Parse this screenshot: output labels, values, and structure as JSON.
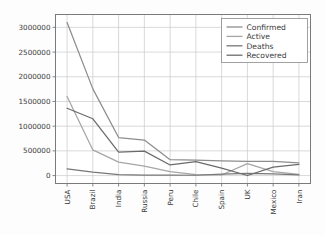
{
  "figure": {
    "background_color": "#fdfdfd",
    "plot_background_color": "#ffffff",
    "frame_color": "#7a7a7a",
    "grid_color": "#c8c8c8",
    "tick_label_color": "#3a3a3a"
  },
  "legend": {
    "position": "upper-right",
    "border_color": "#8a8a8a",
    "background_color": "#ffffff",
    "entries": [
      {
        "label": "Confirmed",
        "color": "#8d8d8d"
      },
      {
        "label": "Active",
        "color": "#a6a6a6"
      },
      {
        "label": "Deaths",
        "color": "#777777"
      },
      {
        "label": "Recovered",
        "color": "#6b6b6b"
      }
    ]
  },
  "axes": {
    "x_tick_rotation": -90,
    "y_tick_labels": [
      "0",
      "500000",
      "1000000",
      "1500000",
      "2000000",
      "2500000",
      "3000000"
    ],
    "y_tick_values": [
      0,
      500000,
      1000000,
      1500000,
      2000000,
      2500000,
      3000000
    ],
    "x_tick_labels": [
      "USA",
      "Brazil",
      "India",
      "Russia",
      "Peru",
      "Chile",
      "Spain",
      "UK",
      "Mexico",
      "Iran"
    ]
  },
  "chart_data": {
    "type": "line",
    "title": "",
    "xlabel": "",
    "ylabel": "",
    "grid": true,
    "legend_position": "upper right",
    "categories": [
      "USA",
      "Brazil",
      "India",
      "Russia",
      "Peru",
      "Chile",
      "Spain",
      "UK",
      "Mexico",
      "Iran"
    ],
    "xlim": [
      -0.45,
      9.45
    ],
    "ylim": [
      -160000,
      3260000
    ],
    "yticks": [
      0,
      500000,
      1000000,
      1500000,
      2000000,
      2500000,
      3000000
    ],
    "series": [
      {
        "name": "Confirmed",
        "color": "#8d8d8d",
        "values": [
          3097000,
          1755000,
          770000,
          720000,
          322000,
          312000,
          300000,
          290000,
          289000,
          259000
        ]
      },
      {
        "name": "Active",
        "color": "#a6a6a6",
        "values": [
          1600000,
          520000,
          272000,
          190000,
          82000,
          22000,
          12000,
          242000,
          80000,
          24000
        ]
      },
      {
        "name": "Deaths",
        "color": "#777777",
        "values": [
          135000,
          69000,
          21000,
          11200,
          11700,
          6900,
          28400,
          44800,
          34000,
          13000
        ]
      },
      {
        "name": "Recovered",
        "color": "#6b6b6b",
        "values": [
          1362000,
          1150000,
          476000,
          496000,
          215000,
          283000,
          150000,
          1400,
          172000,
          225000
        ]
      }
    ]
  }
}
